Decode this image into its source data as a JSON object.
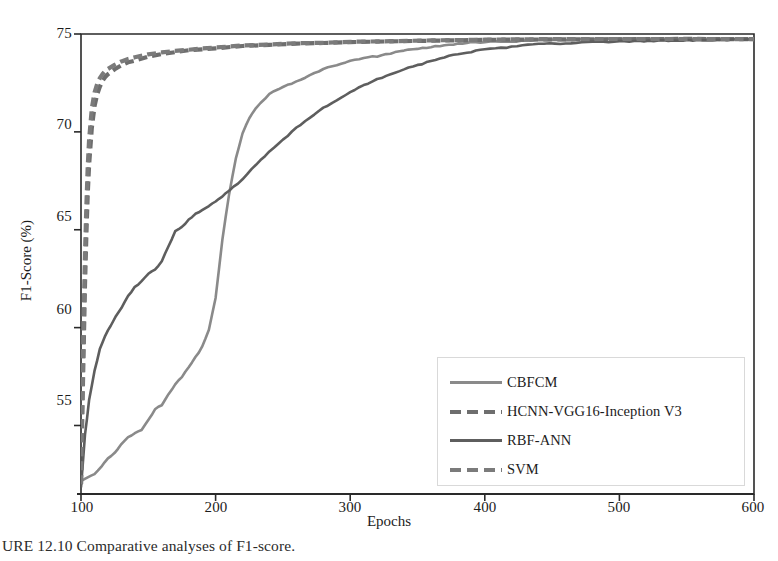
{
  "figure": {
    "caption": "URE 12.10   Comparative analyses of F1-score.",
    "caption_number": "URE 12.10"
  },
  "chart_data": {
    "type": "line",
    "title": "",
    "xlabel": "Epochs",
    "ylabel": "F1-Score (%)",
    "xlim": [
      100,
      600
    ],
    "ylim": [
      51.5,
      75
    ],
    "xticks": [
      100,
      200,
      300,
      400,
      500,
      600
    ],
    "yticks": [
      55,
      60,
      65,
      70,
      75
    ],
    "grid": false,
    "legend_position": "lower-right-inside",
    "series": [
      {
        "name": "CBFCM",
        "style": "solid",
        "color": "#8a8a8a",
        "x": [
          100,
          105,
          110,
          115,
          120,
          125,
          130,
          135,
          140,
          145,
          150,
          155,
          160,
          165,
          170,
          175,
          180,
          185,
          190,
          195,
          200,
          205,
          210,
          215,
          220,
          225,
          230,
          240,
          250,
          260,
          270,
          280,
          290,
          300,
          310,
          320,
          330,
          340,
          350,
          360,
          370,
          380,
          390,
          400,
          420,
          440,
          460,
          480,
          500,
          530,
          560,
          600
        ],
        "values": [
          52.2,
          52.3,
          52.5,
          52.9,
          53.3,
          53.6,
          54.0,
          54.4,
          54.6,
          54.8,
          55.3,
          55.8,
          56.1,
          56.6,
          57.1,
          57.5,
          58.0,
          58.5,
          59.0,
          59.9,
          61.5,
          64.5,
          66.8,
          68.6,
          69.9,
          70.7,
          71.2,
          71.9,
          72.3,
          72.6,
          72.9,
          73.2,
          73.4,
          73.6,
          73.8,
          73.9,
          74.05,
          74.15,
          74.25,
          74.35,
          74.45,
          74.5,
          74.55,
          74.6,
          74.65,
          74.68,
          74.7,
          74.7,
          74.72,
          74.72,
          74.73,
          74.73
        ]
      },
      {
        "name": "HCNN-VGG16-Inception V3",
        "style": "dashed",
        "color": "#6e6e6e",
        "x": [
          100,
          101,
          102,
          103,
          104,
          105,
          106,
          108,
          110,
          112,
          114,
          116,
          118,
          120,
          125,
          130,
          135,
          140,
          150,
          160,
          170,
          180,
          190,
          200,
          220,
          240,
          260,
          280,
          300,
          330,
          360,
          400,
          450,
          500,
          550,
          600
        ],
        "values": [
          52.0,
          55.5,
          59.0,
          62.2,
          64.8,
          66.8,
          68.3,
          70.2,
          71.3,
          71.9,
          72.3,
          72.6,
          72.8,
          72.95,
          73.2,
          73.4,
          73.55,
          73.65,
          73.85,
          73.98,
          74.08,
          74.16,
          74.22,
          74.28,
          74.38,
          74.45,
          74.5,
          74.55,
          74.58,
          74.62,
          74.66,
          74.7,
          74.72,
          74.73,
          74.74,
          74.74
        ]
      },
      {
        "name": "RBF-ANN",
        "style": "solid",
        "color": "#5e5e5e",
        "x": [
          100,
          103,
          106,
          110,
          114,
          118,
          122,
          126,
          130,
          135,
          140,
          145,
          150,
          155,
          160,
          165,
          170,
          175,
          180,
          185,
          190,
          195,
          200,
          205,
          210,
          220,
          230,
          240,
          250,
          260,
          270,
          280,
          290,
          300,
          310,
          320,
          330,
          340,
          350,
          360,
          370,
          380,
          390,
          400,
          420,
          440,
          460,
          480,
          500,
          540,
          580,
          600
        ],
        "values": [
          51.8,
          54.5,
          56.3,
          57.8,
          58.9,
          59.6,
          60.1,
          60.6,
          61.0,
          61.6,
          62.1,
          62.4,
          62.7,
          63.0,
          63.4,
          64.2,
          64.9,
          65.2,
          65.5,
          65.8,
          66.0,
          66.2,
          66.4,
          66.7,
          67.0,
          67.6,
          68.3,
          69.0,
          69.6,
          70.2,
          70.7,
          71.2,
          71.6,
          72.0,
          72.4,
          72.7,
          72.95,
          73.2,
          73.4,
          73.6,
          73.8,
          73.95,
          74.1,
          74.2,
          74.38,
          74.48,
          74.55,
          74.6,
          74.64,
          74.68,
          74.7,
          74.7
        ]
      },
      {
        "name": "SVM",
        "style": "dashed",
        "color": "#7b7b7b",
        "x": [
          100,
          101,
          102,
          103,
          104,
          105,
          106,
          108,
          110,
          112,
          114,
          116,
          118,
          120,
          125,
          130,
          135,
          140,
          150,
          160,
          170,
          180,
          190,
          200,
          220,
          240,
          260,
          280,
          300,
          330,
          360,
          400,
          450,
          500,
          550,
          600
        ],
        "values": [
          52.0,
          56.5,
          60.5,
          63.8,
          66.3,
          68.2,
          69.6,
          71.2,
          72.0,
          72.45,
          72.75,
          72.95,
          73.1,
          73.2,
          73.42,
          73.6,
          73.72,
          73.8,
          73.95,
          74.05,
          74.14,
          74.2,
          74.25,
          74.3,
          74.4,
          74.47,
          74.52,
          74.56,
          74.6,
          74.64,
          74.68,
          74.71,
          74.73,
          74.74,
          74.75,
          74.75
        ]
      }
    ]
  },
  "axes": {
    "x_title": "Epochs",
    "y_title": "F1-Score (%)",
    "x_tick_labels": [
      "100",
      "200",
      "300",
      "400",
      "500",
      "600"
    ],
    "y_tick_labels": [
      "55",
      "60",
      "65",
      "70",
      "75"
    ]
  },
  "legend": {
    "items": [
      {
        "label": "CBFCM",
        "style": "solid",
        "color": "#8a8a8a"
      },
      {
        "label": "HCNN-VGG16-Inception V3",
        "style": "dashed",
        "color": "#6e6e6e"
      },
      {
        "label": "RBF-ANN",
        "style": "solid",
        "color": "#5e5e5e"
      },
      {
        "label": "SVM",
        "style": "dashed",
        "color": "#7b7b7b"
      }
    ]
  },
  "colors": {
    "axis": "#2a2a2a",
    "plot_background": "#ffffff",
    "legend_border": "#d9d9d9",
    "text": "#1c1c1c"
  }
}
